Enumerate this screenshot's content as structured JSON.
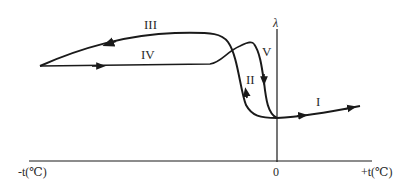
{
  "diagram": {
    "type": "hysteresis-curve",
    "y_axis_label": "λ",
    "x_axis_negative_label": "-t(℃)",
    "x_axis_positive_label": "+t(℃)",
    "origin_label": "0",
    "curves": [
      {
        "id": "I",
        "label": "I",
        "description": "from origin region rising toward +t"
      },
      {
        "id": "II",
        "label": "II",
        "description": "steep rise from low value near 0 going left"
      },
      {
        "id": "III",
        "label": "III",
        "description": "upper branch returning toward -t"
      },
      {
        "id": "IV",
        "label": "IV",
        "description": "lower branch going from -t rightward"
      },
      {
        "id": "V",
        "label": "V",
        "description": "steep drop toward origin"
      }
    ],
    "line_color": "#1a1a1a"
  }
}
